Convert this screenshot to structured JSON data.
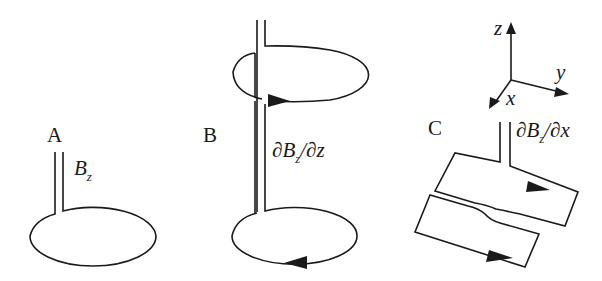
{
  "figure": {
    "panels": [
      {
        "id": "A",
        "label": "A",
        "quantity": {
          "main": "B",
          "sub": "z"
        },
        "description": "single loop gradiometer (magnetometer)"
      },
      {
        "id": "B",
        "label": "B",
        "quantity": {
          "pre": "∂B",
          "sub": "z",
          "post": "/∂z"
        },
        "description": "axial first-order gradiometer, two counter-wound loops"
      },
      {
        "id": "C",
        "label": "C",
        "quantity": {
          "pre": "∂B",
          "sub": "z",
          "post": "/∂x"
        },
        "description": "planar first-order gradiometer, two side-by-side loops"
      }
    ],
    "axes": {
      "z": "z",
      "y": "y",
      "x": "x"
    },
    "colors": {
      "line": "#1a1a1a",
      "background": "#ffffff"
    }
  }
}
